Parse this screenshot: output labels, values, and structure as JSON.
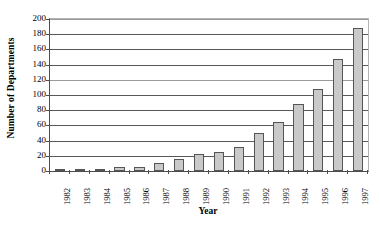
{
  "chart_data": {
    "type": "bar",
    "title": "",
    "xlabel": "Year",
    "ylabel": "Number of Departments",
    "categories": [
      "1982",
      "1983",
      "1984",
      "1985",
      "1986",
      "1987",
      "1988",
      "1989",
      "1990",
      "1991",
      "1992",
      "1993",
      "1994",
      "1995",
      "1996",
      "1997"
    ],
    "values": [
      1,
      1,
      2,
      5,
      5,
      11,
      16,
      22,
      25,
      32,
      50,
      65,
      88,
      108,
      148,
      188
    ],
    "ylim": [
      0,
      200
    ],
    "y_ticks": [
      0,
      20,
      40,
      60,
      80,
      100,
      120,
      140,
      160,
      180,
      200
    ],
    "y_tick_labels": [
      "0",
      "20",
      "40",
      "60",
      "80",
      "100",
      "120",
      "140",
      "160",
      "180",
      "200"
    ],
    "grid": true,
    "grid_axis": "y",
    "legend": false,
    "legend_position": "none",
    "bar_fill_color": "#c9c9c9",
    "bar_border_color": "#555555",
    "gridline_color": "#585858",
    "axis_color": "#4c4c4c",
    "background_color": "#ffffff",
    "x_tick_label_rotation": -90
  }
}
